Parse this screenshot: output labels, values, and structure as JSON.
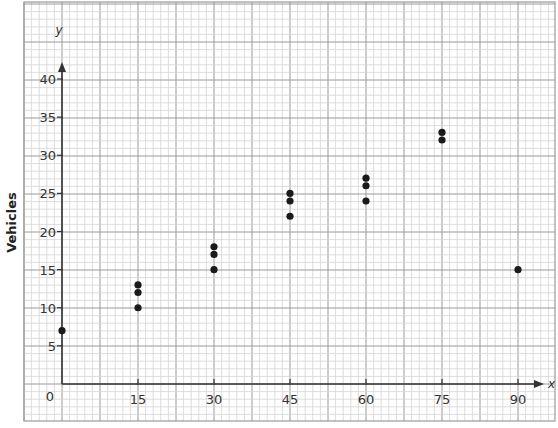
{
  "chart_data": {
    "type": "scatter",
    "title": "",
    "xlabel": "x",
    "ylabel": "Vehicles",
    "y_axis_letter": "y",
    "x_ticks": [
      0,
      15,
      30,
      45,
      60,
      75,
      90
    ],
    "y_ticks": [
      0,
      5,
      10,
      15,
      20,
      25,
      30,
      35,
      40
    ],
    "xlim": [
      0,
      95
    ],
    "ylim": [
      0,
      44
    ],
    "grid": true,
    "grid_style": "graph paper (minor every 1.5 x-units / 1 y-unit, major every 7.5 x-units / 5 y-units)",
    "legend": null,
    "points": [
      {
        "x": 0,
        "y": 7
      },
      {
        "x": 15,
        "y": 10
      },
      {
        "x": 15,
        "y": 12
      },
      {
        "x": 15,
        "y": 13
      },
      {
        "x": 30,
        "y": 15
      },
      {
        "x": 30,
        "y": 17
      },
      {
        "x": 30,
        "y": 18
      },
      {
        "x": 45,
        "y": 22
      },
      {
        "x": 45,
        "y": 24
      },
      {
        "x": 45,
        "y": 25
      },
      {
        "x": 60,
        "y": 24
      },
      {
        "x": 60,
        "y": 26
      },
      {
        "x": 60,
        "y": 27
      },
      {
        "x": 75,
        "y": 32
      },
      {
        "x": 75,
        "y": 33
      },
      {
        "x": 90,
        "y": 15
      }
    ]
  },
  "colors": {
    "minor_grid": "#d4d4d4",
    "major_grid": "#9a9a9a",
    "axis": "#333333",
    "point": "#1a1a1a"
  },
  "labels": {
    "ylabel": "Vehicles",
    "y_letter": "y",
    "x_letter": "x"
  }
}
